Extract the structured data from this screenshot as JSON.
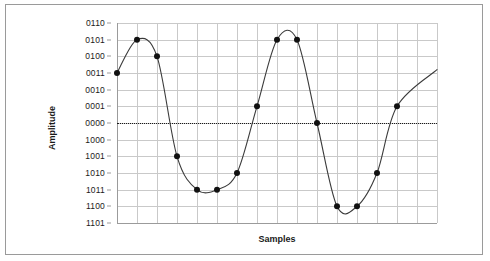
{
  "chart_data": {
    "type": "line",
    "title": "",
    "xlabel": "Samples",
    "ylabel": "Amplitude",
    "grid": true,
    "legend": false,
    "y_tick_labels": [
      "0110",
      "0101",
      "0100",
      "0011",
      "0010",
      "0001",
      "0000",
      "1000",
      "1001",
      "1010",
      "1011",
      "1100",
      "1101"
    ],
    "y_tick_values": [
      6,
      5,
      4,
      3,
      2,
      1,
      0,
      0,
      -1,
      -2,
      -3,
      -4,
      -5
    ],
    "y_encoding": "4-bit sign-magnitude binary; leading 1 denotes negative",
    "ylim": [
      -5,
      6
    ],
    "x_tick_labels": [],
    "xlim": [
      0,
      16
    ],
    "zero_line": {
      "label": "0000",
      "value": 0,
      "style": "dotted"
    },
    "x": [
      0,
      1,
      2,
      3,
      4,
      5,
      6,
      7,
      8,
      9,
      10,
      11,
      12,
      13,
      14
    ],
    "values": [
      3,
      5,
      4,
      -1,
      -3,
      -3,
      -2,
      1,
      5,
      5,
      0,
      -4,
      -4,
      -2,
      1
    ],
    "point_labels": [
      "0011",
      "0101",
      "0100",
      "1001",
      "1011",
      "1011",
      "1010",
      "0001",
      "0101",
      "0101",
      "0000",
      "1100",
      "1100",
      "1010",
      "0001"
    ],
    "series": [
      {
        "name": "sampled waveform",
        "values": [
          3,
          5,
          4,
          -1,
          -3,
          -3,
          -2,
          1,
          5,
          5,
          0,
          -4,
          -4,
          -2,
          1
        ],
        "marker": "filled-circle",
        "line": "smooth-sine"
      }
    ]
  },
  "axes": {
    "y_title": "Amplitude",
    "x_title": "Samples"
  }
}
